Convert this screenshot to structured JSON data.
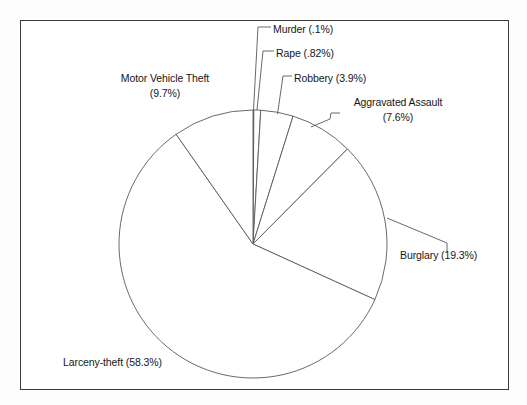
{
  "figure": {
    "background_color": "#fdfdfd",
    "canvas_color": "#ffffff",
    "frame_color": "#3a3a3a",
    "line_color": "#55595c",
    "text_color": "#161616"
  },
  "chart_data": {
    "type": "pie",
    "title": "",
    "subtitle": "",
    "xlabel": "",
    "ylabel": "",
    "grid": false,
    "legend_position": "none",
    "label_style": "outside-with-leader-lines",
    "start_angle_deg": 0,
    "direction": "clockwise",
    "slice_fill": "none",
    "categories": [
      "Murder",
      "Rape",
      "Robbery",
      "Aggravated Assault",
      "Burglary",
      "Larceny-theft",
      "Motor Vehicle Theft"
    ],
    "values": [
      0.1,
      0.82,
      3.9,
      7.6,
      19.3,
      58.3,
      9.7
    ],
    "unit": "%",
    "labels": [
      "Murder (.1%)",
      "Rape (.82%)",
      "Robbery (3.9%)",
      "Aggravated Assault\n(7.6%)",
      "Burglary (19.3%)",
      "Larceny-theft (58.3%)",
      "Motor Vehicle Theft\n(9.7%)"
    ]
  },
  "labels": {
    "murder": "Murder (.1%)",
    "rape": "Rape (.82%)",
    "robbery": "Robbery (3.9%)",
    "aggravated_assault_name": "Aggravated Assault",
    "aggravated_assault_value": "(7.6%)",
    "burglary": "Burglary (19.3%)",
    "larceny": "Larceny-theft (58.3%)",
    "motor_vehicle_theft_name": "Motor Vehicle Theft",
    "motor_vehicle_theft_value": "(9.7%)"
  }
}
